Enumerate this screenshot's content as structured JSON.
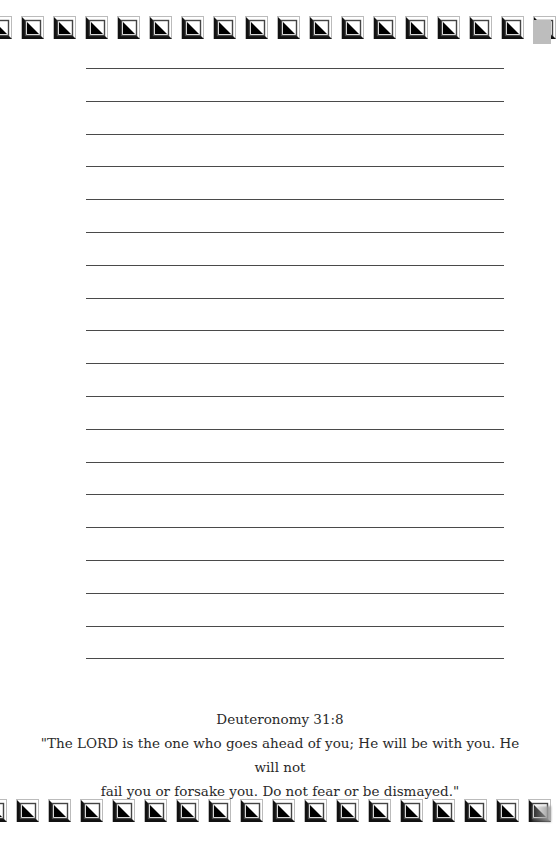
{
  "page": {
    "type": "lined-notebook-page",
    "line_count": 19,
    "first_line_y": 68,
    "line_spacing": 32.8,
    "colors": {
      "background": "#ffffff",
      "rule_line": "#4a4a4a",
      "border_tile_dark": "#000000",
      "text": "#2a2a2a"
    }
  },
  "border": {
    "icon": "square-diagonal-triangle-tile",
    "top_tile_count": 17,
    "bottom_tile_count": 17,
    "tile_spacing": 32
  },
  "verse": {
    "reference": "Deuteronomy 31:8",
    "lines": [
      "\"The LORD is the one who goes ahead of you; He will be with you. He will not",
      "fail you or forsake you. Do not fear or be dismayed.\""
    ]
  }
}
